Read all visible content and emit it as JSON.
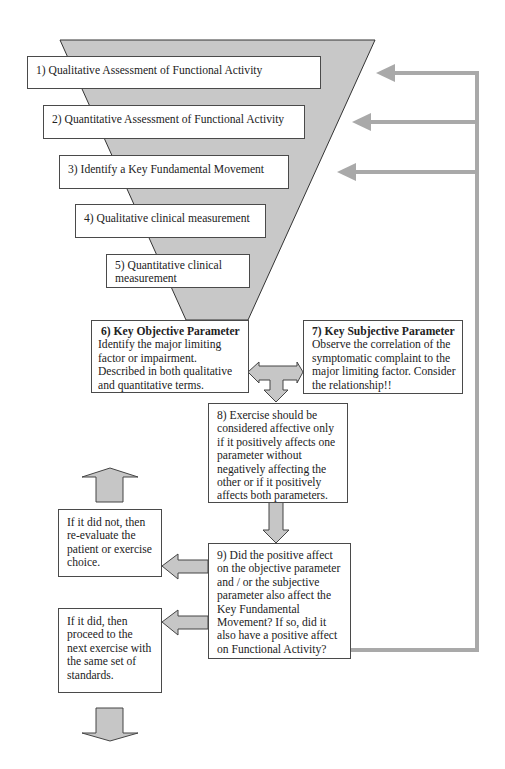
{
  "colors": {
    "funnel_fill": "#c8c8c8",
    "arrow_fill": "#c6c6c6",
    "connector": "#a9a9a9",
    "border": "#4a4a4a"
  },
  "funnel": {
    "steps": [
      {
        "label": "1) Qualitative Assessment of Functional Activity"
      },
      {
        "label": "2) Quantitative Assessment of Functional Activity"
      },
      {
        "label": "3) Identify a Key Fundamental Movement"
      },
      {
        "label": "4) Qualitative clinical measurement"
      },
      {
        "label": "5) Quantitative clinical measurement"
      }
    ]
  },
  "parameters": {
    "objective": {
      "title": "6) Key Objective Parameter",
      "body": "Identify the major limiting factor or impairment. Described in both qualitative and quantitative terms."
    },
    "subjective": {
      "title": "7) Key Subjective Parameter",
      "body": "Observe the correlation of the symptomatic complaint to the major limiting factor.  Consider the relationship!!"
    }
  },
  "step8": {
    "text": "8) Exercise should be considered affective only if it positively affects one parameter without negatively affecting the other or if it positively affects both parameters."
  },
  "step9": {
    "text": "9) Did the positive affect on the objective parameter and / or the subjective parameter also affect the Key Fundamental Movement? If so, did it also have a positive affect on Functional Activity?"
  },
  "outcomes": {
    "did_not": "If it did not, then re-evaluate the patient or exercise choice.",
    "did": "If it did, then proceed to the next exercise with the same set of standards."
  }
}
